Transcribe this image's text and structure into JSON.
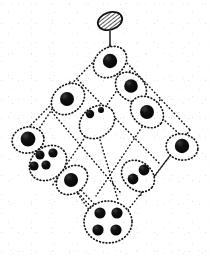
{
  "figure": {
    "title_fragment": "",
    "style": "hand-drawn dotted/stippled scanned diagram",
    "background_color": "#ffffff",
    "ink_color": "#111111",
    "stroke_style": "dotted"
  },
  "top_marker": {
    "name": "hatched-oval",
    "shape": "ellipse",
    "fill_pattern": "hatching",
    "cx": 110,
    "cy": 22,
    "rx": 13,
    "ry": 9,
    "rotation_deg": -18,
    "stem": {
      "x1": 110,
      "y1": 31,
      "x2": 110,
      "y2": 47
    }
  },
  "lattice": {
    "rows": 5,
    "orientation": "diamond",
    "node_count": 10,
    "nodes": [
      {
        "id": "n-top",
        "label": "top",
        "cx": 110,
        "cy": 62,
        "rx": 18,
        "ry": 14,
        "rot": -38,
        "dots": 1,
        "dot_layout": "single"
      },
      {
        "id": "n-upper-left",
        "label": "upper-left",
        "cx": 68,
        "cy": 99,
        "rx": 18,
        "ry": 14,
        "rot": -38,
        "dots": 1,
        "dot_layout": "single"
      },
      {
        "id": "n-upper-right",
        "label": "upper-right",
        "cx": 131,
        "cy": 87,
        "rx": 17,
        "ry": 13,
        "rot": 40,
        "dots": 1,
        "dot_layout": "single"
      },
      {
        "id": "n-mid-right-a",
        "label": "mid-right-a",
        "cx": 147,
        "cy": 112,
        "rx": 18,
        "ry": 14,
        "rot": 40,
        "dots": 1,
        "dot_layout": "single"
      },
      {
        "id": "n-center",
        "label": "center",
        "cx": 97,
        "cy": 122,
        "rx": 19,
        "ry": 15,
        "rot": -38,
        "dots": 2,
        "dot_layout": "pair-diagonal"
      },
      {
        "id": "n-far-left",
        "label": "far-left",
        "cx": 28,
        "cy": 140,
        "rx": 16,
        "ry": 13,
        "rot": -10,
        "dots": 1,
        "dot_layout": "single"
      },
      {
        "id": "n-far-right",
        "label": "far-right",
        "cx": 182,
        "cy": 147,
        "rx": 16,
        "ry": 13,
        "rot": 10,
        "dots": 1,
        "dot_layout": "single"
      },
      {
        "id": "n-lower-left",
        "label": "lower-left",
        "cx": 48,
        "cy": 163,
        "rx": 20,
        "ry": 16,
        "rot": -38,
        "dots": 4,
        "dot_layout": "quad"
      },
      {
        "id": "n-lower-mid",
        "label": "lower-middle",
        "cx": 72,
        "cy": 180,
        "rx": 17,
        "ry": 13,
        "rot": -38,
        "dots": 1,
        "dot_layout": "single"
      },
      {
        "id": "n-lower-right",
        "label": "lower-right",
        "cx": 138,
        "cy": 176,
        "rx": 18,
        "ry": 14,
        "rot": 40,
        "dots": 2,
        "dot_layout": "pair-diagonal"
      },
      {
        "id": "n-bottom",
        "label": "bottom",
        "cx": 108,
        "cy": 222,
        "rx": 24,
        "ry": 21,
        "rot": 0,
        "dots": 4,
        "dot_layout": "quad"
      }
    ],
    "edges": [
      {
        "from": "n-top",
        "to": "n-upper-left"
      },
      {
        "from": "n-top",
        "to": "n-upper-right"
      },
      {
        "from": "n-upper-left",
        "to": "n-center"
      },
      {
        "from": "n-upper-left",
        "to": "n-far-left"
      },
      {
        "from": "n-upper-right",
        "to": "n-center"
      },
      {
        "from": "n-upper-right",
        "to": "n-mid-right-a"
      },
      {
        "from": "n-mid-right-a",
        "to": "n-far-right"
      },
      {
        "from": "n-center",
        "to": "n-lower-mid"
      },
      {
        "from": "n-center",
        "to": "n-lower-right"
      },
      {
        "from": "n-far-left",
        "to": "n-lower-left"
      },
      {
        "from": "n-lower-left",
        "to": "n-bottom"
      },
      {
        "from": "n-lower-mid",
        "to": "n-bottom"
      },
      {
        "from": "n-lower-right",
        "to": "n-bottom"
      },
      {
        "from": "n-far-right",
        "to": "n-lower-right"
      }
    ]
  }
}
